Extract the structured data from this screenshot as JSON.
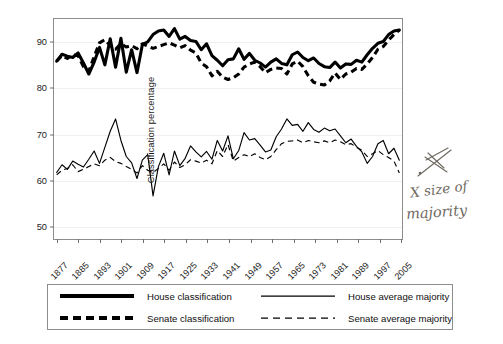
{
  "figure": {
    "background_color": "#ffffff",
    "axis_color": "#8d8d8d",
    "series_color": "#000000",
    "gridline_color": "#f0f0f0"
  },
  "annotation": {
    "name": "handwritten-note",
    "line1": "X size of",
    "line2": "majority",
    "color": "#6f6a62",
    "has_arrow": true,
    "has_cross_mark": true
  },
  "legend": {
    "items": [
      {
        "label": "House classification",
        "style": "thick-solid",
        "name": "house-classification"
      },
      {
        "label": "Senate classification",
        "style": "thick-dashed",
        "name": "senate-classification"
      },
      {
        "label": "House average majority",
        "style": "thin-solid",
        "name": "house-average-majority"
      },
      {
        "label": "Senate average majority",
        "style": "thin-dashed",
        "name": "senate-average-majority"
      }
    ]
  },
  "chart_data": {
    "type": "line",
    "title": "",
    "xlabel": "",
    "ylabel": "Classification percentage",
    "xlim": [
      1876,
      2006
    ],
    "ylim": [
      47,
      95
    ],
    "grid": true,
    "grid_axis": "y",
    "legend_position": "below",
    "yticks": [
      50,
      60,
      70,
      80,
      90
    ],
    "xticks": [
      1877,
      1885,
      1893,
      1901,
      1909,
      1917,
      1925,
      1933,
      1941,
      1949,
      1957,
      1965,
      1973,
      1981,
      1989,
      1997,
      2005
    ],
    "xticklabels": [
      "1877",
      "1885",
      "1893",
      "1901",
      "1909",
      "1917",
      "1925",
      "1933",
      "1941",
      "1949",
      "1957",
      "1965",
      "1973",
      "1981",
      "1989",
      "1997",
      "2005"
    ],
    "x": [
      1877,
      1879,
      1881,
      1883,
      1885,
      1887,
      1889,
      1891,
      1893,
      1895,
      1897,
      1899,
      1901,
      1903,
      1905,
      1907,
      1909,
      1911,
      1913,
      1915,
      1917,
      1919,
      1921,
      1923,
      1925,
      1927,
      1929,
      1931,
      1933,
      1935,
      1937,
      1939,
      1941,
      1943,
      1945,
      1947,
      1949,
      1951,
      1953,
      1955,
      1957,
      1959,
      1961,
      1963,
      1965,
      1967,
      1969,
      1971,
      1973,
      1975,
      1977,
      1979,
      1981,
      1983,
      1985,
      1987,
      1989,
      1991,
      1993,
      1995,
      1997,
      1999,
      2001,
      2003,
      2005
    ],
    "series": [
      {
        "name": "House classification",
        "style": "thick-solid",
        "values": [
          85.8,
          87.3,
          86.9,
          86.6,
          87.6,
          85.4,
          83.0,
          85.6,
          88.8,
          85.0,
          90.7,
          84.5,
          90.8,
          83.4,
          88.3,
          83.3,
          89.4,
          90.0,
          91.6,
          92.4,
          92.6,
          91.2,
          92.9,
          90.6,
          91.2,
          90.3,
          90.1,
          88.3,
          89.6,
          87.0,
          86.0,
          84.8,
          86.1,
          86.3,
          88.5,
          86.2,
          87.5,
          86.0,
          85.4,
          84.5,
          85.6,
          86.3,
          85.3,
          85.0,
          87.2,
          87.8,
          86.6,
          85.9,
          86.5,
          85.3,
          84.6,
          84.4,
          85.6,
          84.3,
          85.2,
          85.1,
          86.0,
          85.6,
          87.2,
          88.6,
          89.7,
          90.1,
          91.6,
          92.4,
          92.6
        ]
      },
      {
        "name": "Senate classification",
        "style": "thick-dashed",
        "values": [
          85.8,
          87.0,
          86.4,
          87.2,
          87.0,
          84.6,
          83.6,
          86.8,
          89.8,
          90.5,
          89.2,
          88.4,
          89.6,
          88.9,
          89.2,
          88.5,
          89.6,
          89.1,
          88.6,
          89.0,
          89.4,
          89.8,
          89.3,
          88.7,
          89.2,
          88.2,
          87.6,
          85.4,
          84.6,
          82.6,
          83.6,
          82.3,
          81.8,
          82.2,
          83.0,
          84.5,
          85.2,
          85.6,
          84.6,
          83.3,
          84.0,
          84.3,
          84.2,
          83.0,
          85.2,
          85.8,
          84.6,
          82.6,
          81.2,
          80.8,
          80.6,
          81.5,
          83.2,
          81.8,
          83.0,
          83.4,
          84.2,
          84.0,
          85.2,
          86.6,
          88.4,
          89.0,
          90.4,
          91.6,
          92.6
        ]
      },
      {
        "name": "House average majority",
        "style": "thin-solid",
        "values": [
          61.5,
          63.2,
          62.2,
          64.0,
          63.3,
          62.7,
          64.4,
          66.2,
          63.5,
          67.0,
          70.5,
          73.2,
          68.5,
          65.0,
          63.6,
          60.2,
          64.2,
          65.4,
          56.4,
          62.8,
          65.7,
          61.0,
          66.2,
          63.0,
          64.6,
          67.3,
          66.0,
          64.9,
          66.1,
          64.4,
          68.5,
          66.2,
          69.5,
          64.5,
          66.3,
          70.2,
          68.6,
          68.9,
          67.5,
          66.0,
          66.4,
          69.3,
          71.0,
          73.2,
          71.8,
          72.0,
          70.5,
          72.4,
          70.9,
          70.3,
          71.2,
          70.6,
          71.0,
          69.5,
          68.0,
          68.8,
          67.2,
          66.0,
          63.5,
          65.0,
          67.8,
          68.5,
          65.6,
          66.8,
          64.2
        ]
      },
      {
        "name": "Senate average majority",
        "style": "thin-dashed",
        "values": [
          61.0,
          62.0,
          62.4,
          63.2,
          61.7,
          62.2,
          62.8,
          63.4,
          63.0,
          64.2,
          64.8,
          63.9,
          63.5,
          62.8,
          62.2,
          61.4,
          63.0,
          62.0,
          61.5,
          62.4,
          63.4,
          62.0,
          63.8,
          62.6,
          63.2,
          64.3,
          64.0,
          63.6,
          64.2,
          63.4,
          66.3,
          65.0,
          67.6,
          64.0,
          64.8,
          65.4,
          65.0,
          65.6,
          64.8,
          64.3,
          65.0,
          66.5,
          67.8,
          68.3,
          68.4,
          68.6,
          68.0,
          68.5,
          68.2,
          68.0,
          68.4,
          68.0,
          68.6,
          68.2,
          67.6,
          67.8,
          67.0,
          66.4,
          65.0,
          65.6,
          66.3,
          65.4,
          64.8,
          64.0,
          61.4
        ]
      }
    ]
  }
}
